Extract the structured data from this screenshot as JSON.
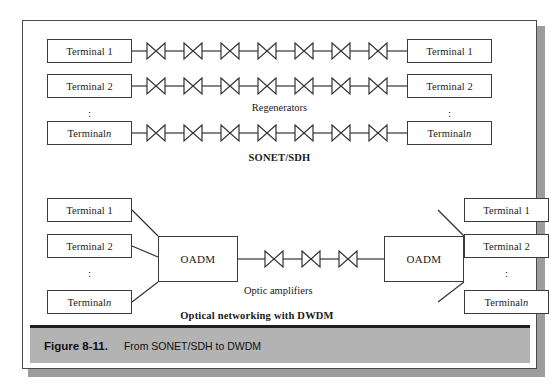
{
  "figure": {
    "caption_number": "Figure 8-11.",
    "caption_text": "From SONET/SDH to DWDM"
  },
  "colors": {
    "frame_border": "#4a4a4a",
    "box_border": "#3b3b3b",
    "line": "#333333",
    "caption_bar_bg": "#b3b3b3",
    "caption_bar_rule": "#1e1e1e",
    "shadow": "#9c9c9c",
    "page_bg": "#ffffff"
  },
  "top_section": {
    "title": "SONET/SDH",
    "middle_label": "Regenerators",
    "regenerators_per_row": 7,
    "rows": [
      {
        "left_terminal": "Terminal 1",
        "left_terminal_suffix": "",
        "right_terminal": "Terminal 1",
        "right_terminal_suffix": ""
      },
      {
        "left_terminal": "Terminal 2",
        "left_terminal_suffix": "",
        "right_terminal": "Terminal 2",
        "right_terminal_suffix": ""
      },
      {
        "left_terminal": "Terminal ",
        "left_terminal_suffix": "n",
        "right_terminal": "Terminal ",
        "right_terminal_suffix": "n"
      }
    ],
    "left_ellipsis": ":",
    "right_ellipsis": ":"
  },
  "bottom_section": {
    "title": "Optical networking with DWDM",
    "amplifier_label": "Optic amplifiers",
    "amplifier_count": 3,
    "left_node": "OADM",
    "right_node": "OADM",
    "left_terminals": [
      {
        "label": "Terminal 1",
        "suffix": ""
      },
      {
        "label": "Terminal 2",
        "suffix": ""
      },
      {
        "label": "Terminal ",
        "suffix": "n"
      }
    ],
    "right_terminals": [
      {
        "label": "Terminal 1",
        "suffix": ""
      },
      {
        "label": "Terminal 2",
        "suffix": ""
      },
      {
        "label": "Terminal ",
        "suffix": "n"
      }
    ],
    "left_ellipsis": ":",
    "right_ellipsis": ":"
  },
  "symbols": {
    "regenerator": "bowtie-icon",
    "optic_amplifier": "bowtie-icon"
  }
}
